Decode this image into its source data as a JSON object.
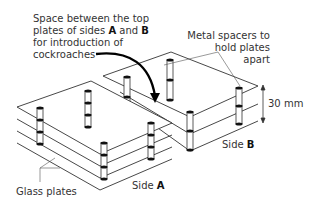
{
  "figure": {
    "type": "diagram"
  },
  "labels": {
    "space": {
      "line1": "Space between the top",
      "line2_pre": "plates of sides ",
      "line2_a": "A",
      "line2_mid": " and ",
      "line2_b": "B",
      "line3": "for introduction of",
      "line4": "cockroaches"
    },
    "spacers": {
      "line1": "Metal spacers to",
      "line2": "hold plates",
      "line3": "apart"
    },
    "gap": "30 mm",
    "side_b_pre": "Side ",
    "side_b": "B",
    "side_a_pre": "Side ",
    "side_a": "A",
    "glass": "Glass plates"
  },
  "stacks": {
    "side_a": {
      "plates": 4,
      "plate_spacing_px": 12
    },
    "side_b": {
      "plates": 3,
      "plate_spacing_px": 17
    }
  },
  "colors": {
    "line": "#333333",
    "arrow": "#000000",
    "spacer_cap": "#111111"
  }
}
